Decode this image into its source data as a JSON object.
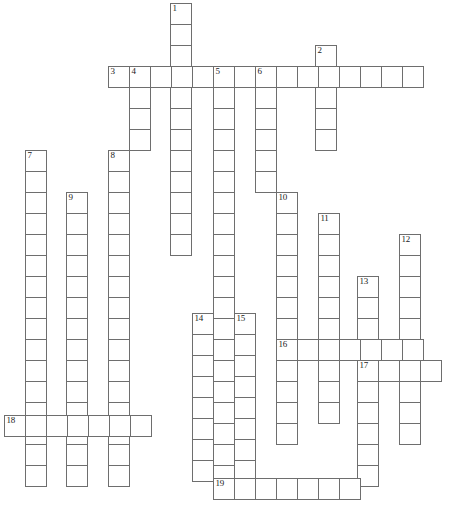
{
  "puzzle": {
    "type": "crossword-grid",
    "title": "Crossword puzzle grid",
    "cell_size": 21,
    "grid_color": "#6e6e6e",
    "cell_fill": "#ffffff",
    "background": "#ffffff",
    "width": 452,
    "height": 509,
    "clue_numbers": [
      1,
      2,
      3,
      4,
      5,
      6,
      7,
      8,
      9,
      10,
      11,
      12,
      13,
      14,
      15,
      16,
      17,
      18,
      19
    ],
    "entries": [
      {
        "number": 1,
        "direction": "down",
        "length": 12,
        "x": 170,
        "y": 3,
        "label": "1"
      },
      {
        "number": 2,
        "direction": "down",
        "length": 5,
        "x": 315,
        "y": 45,
        "label": "2"
      },
      {
        "number": 3,
        "direction": "across",
        "length": 15,
        "x": 108,
        "y": 66,
        "label": "3"
      },
      {
        "number": 4,
        "direction": "down",
        "length": 4,
        "x": 129,
        "y": 66,
        "label": "4"
      },
      {
        "number": 5,
        "direction": "down",
        "length": 19,
        "x": 213,
        "y": 66,
        "label": "5"
      },
      {
        "number": 6,
        "direction": "down",
        "length": 6,
        "x": 255,
        "y": 66,
        "label": "6"
      },
      {
        "number": 7,
        "direction": "down",
        "length": 16,
        "x": 25,
        "y": 150,
        "label": "7"
      },
      {
        "number": 8,
        "direction": "down",
        "length": 16,
        "x": 108,
        "y": 150,
        "label": "8"
      },
      {
        "number": 9,
        "direction": "down",
        "length": 14,
        "x": 66,
        "y": 192,
        "label": "9"
      },
      {
        "number": 10,
        "direction": "down",
        "length": 12,
        "x": 276,
        "y": 192,
        "label": "10"
      },
      {
        "number": 11,
        "direction": "down",
        "length": 10,
        "x": 318,
        "y": 213,
        "label": "11"
      },
      {
        "number": 12,
        "direction": "down",
        "length": 10,
        "x": 399,
        "y": 234,
        "label": "12"
      },
      {
        "number": 13,
        "direction": "down",
        "length": 10,
        "x": 357,
        "y": 276,
        "label": "13"
      },
      {
        "number": 14,
        "direction": "down",
        "length": 8,
        "x": 192,
        "y": 313,
        "label": "14"
      },
      {
        "number": 15,
        "direction": "down",
        "length": 8,
        "x": 234,
        "y": 313,
        "label": "15"
      },
      {
        "number": 16,
        "direction": "across",
        "length": 7,
        "x": 276,
        "y": 339,
        "label": "16"
      },
      {
        "number": 17,
        "direction": "across",
        "length": 4,
        "x": 357,
        "y": 360,
        "label": "17"
      },
      {
        "number": 18,
        "direction": "across",
        "length": 7,
        "x": 4,
        "y": 415,
        "label": "18"
      },
      {
        "number": 19,
        "direction": "across",
        "length": 7,
        "x": 213,
        "y": 478,
        "label": "19"
      }
    ]
  }
}
